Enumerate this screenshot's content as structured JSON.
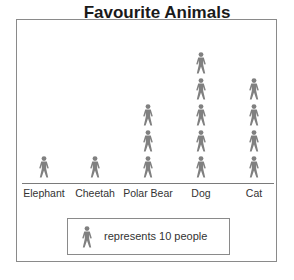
{
  "chart_data": {
    "type": "pictograph",
    "title": "Favourite Animals",
    "categories": [
      "Elephant",
      "Cheetah",
      "Polar Bear",
      "Dog",
      "Cat"
    ],
    "icon_counts": [
      1,
      1,
      3,
      5,
      4
    ],
    "values": [
      10,
      10,
      30,
      50,
      40
    ],
    "key": {
      "icon": "person-icon",
      "text": "represents 10 people",
      "value_per_icon": 10
    },
    "xlabel": "",
    "ylabel": "",
    "grid": false,
    "icon_color": "#808080"
  }
}
